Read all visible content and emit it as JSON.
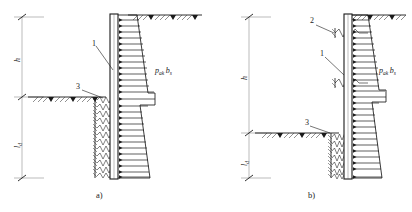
{
  "figure": {
    "panels": [
      {
        "id": "a",
        "caption": "a)",
        "dimensions": [
          {
            "name": "h",
            "symbol": "h",
            "sub": "",
            "meaning": "height above excavation level"
          },
          {
            "name": "ld",
            "symbol": "l",
            "sub": "d",
            "meaning": "embedment depth below excavation level"
          }
        ],
        "callouts": [
          {
            "number": "1",
            "meaning": "retaining wall"
          },
          {
            "number": "3",
            "meaning": "soil spring below excavation level"
          }
        ],
        "load_label": {
          "p": "p",
          "p_sub": "ak",
          "b": "b",
          "b_sub": "s"
        },
        "ground_surface_left_label": "excavation level",
        "ground_surface_right_label": "original ground level",
        "has_upper_anchors": false,
        "soil_spring_rows": 11,
        "pressure_arrow_count": 25
      },
      {
        "id": "b",
        "caption": "b)",
        "dimensions": [
          {
            "name": "h",
            "symbol": "h",
            "sub": "",
            "meaning": "height above excavation level"
          },
          {
            "name": "ld",
            "symbol": "l",
            "sub": "d",
            "meaning": "embedment depth below excavation level"
          }
        ],
        "callouts": [
          {
            "number": "2",
            "meaning": "anchor / strut spring"
          },
          {
            "number": "1",
            "meaning": "retaining wall"
          },
          {
            "number": "3",
            "meaning": "soil spring below excavation level"
          }
        ],
        "load_label": {
          "p": "p",
          "p_sub": "ak",
          "b": "b",
          "b_sub": "s"
        },
        "ground_surface_left_label": "excavation level",
        "ground_surface_right_label": "original ground level",
        "has_upper_anchors": true,
        "anchor_count": 2,
        "soil_spring_rows": 7,
        "pressure_arrow_count": 25
      }
    ],
    "colors": {
      "line": "#1a1a1a",
      "thin_line": "#555555",
      "background": "#ffffff",
      "hatch": "#333333"
    }
  }
}
